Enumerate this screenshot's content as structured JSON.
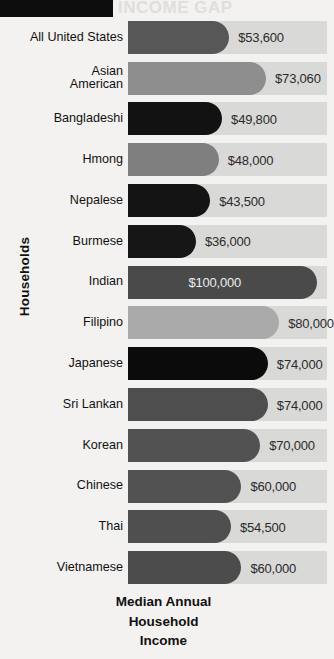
{
  "banner": {
    "title_partial": "INCOME GAP"
  },
  "chart_data": {
    "type": "bar",
    "orientation": "horizontal",
    "title": "",
    "xlabel": "Median Annual Household Income",
    "ylabel": "Households",
    "xlim": [
      0,
      100000
    ],
    "grid": false,
    "legend": false,
    "categories": [
      "All United States",
      "Asian\nAmerican",
      "Bangladeshi",
      "Hmong",
      "Nepalese",
      "Burmese",
      "Indian",
      "Filipino",
      "Japanese",
      "Sri Lankan",
      "Korean",
      "Chinese",
      "Thai",
      "Vietnamese"
    ],
    "values": [
      53600,
      73060,
      49800,
      48000,
      43500,
      36000,
      100000,
      80000,
      74000,
      74000,
      70000,
      60000,
      54500,
      60000
    ],
    "value_labels": [
      "$53,600",
      "$73,060",
      "$49,800",
      "$48,000",
      "$43,500",
      "$36,000",
      "$100,000",
      "$80,000",
      "$74,000",
      "$74,000",
      "$70,000",
      "$60,000",
      "$54,500",
      "$60,000"
    ],
    "bar_colors": [
      "#575757",
      "#8e8e8e",
      "#121212",
      "#7f7f7f",
      "#141414",
      "#161616",
      "#4a4a4a",
      "#aaaaaa",
      "#0b0b0b",
      "#4e4e4e",
      "#525252",
      "#525252",
      "#4f4f4f",
      "#4c4c4c"
    ],
    "label_inside": [
      false,
      false,
      false,
      false,
      false,
      false,
      true,
      false,
      false,
      false,
      false,
      false,
      false,
      false
    ],
    "track_color": "#d9d9d7",
    "background_color": "#f3f2f0"
  },
  "caption": {
    "line1": "Median Annual",
    "line2": "Household",
    "line3": "Income"
  }
}
